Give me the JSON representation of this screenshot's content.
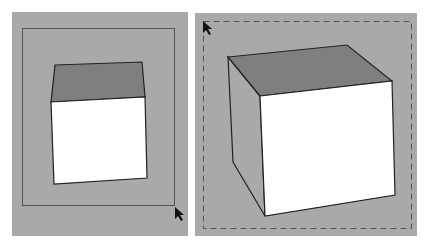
{
  "colors": {
    "page_background": "#ffffff",
    "viewport_background": "#a9a9a9",
    "top_face": "#7f7f7f",
    "front_face": "#ffffff",
    "side_face": "#a9a9a9",
    "edge": "#222222",
    "frame_line": "#555555"
  },
  "panels": [
    {
      "name": "left-viewport",
      "selection_frame": "solid",
      "object": "box",
      "cursor": "arrow"
    },
    {
      "name": "right-viewport",
      "selection_frame": "dashed",
      "object": "box",
      "cursor": "arrow"
    }
  ]
}
